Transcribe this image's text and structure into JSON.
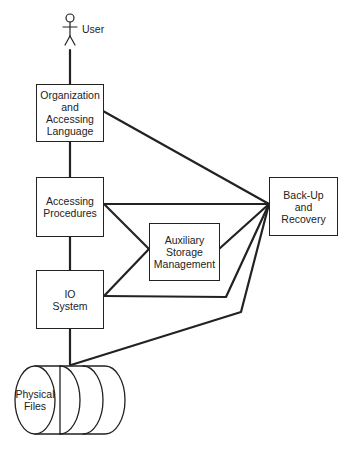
{
  "diagram": {
    "actor": {
      "label": "User"
    },
    "nodes": {
      "org_lang": {
        "label": "Organization\nand\nAccessing\nLanguage"
      },
      "access_proc": {
        "label": "Accessing\nProcedures"
      },
      "io_system": {
        "label": "IO\nSystem"
      },
      "aux_storage": {
        "label": "Auxiliary\nStorage\nManagement"
      },
      "backup": {
        "label": "Back-Up\nand\nRecovery"
      },
      "physical_files": {
        "label": "Physical\nFiles"
      }
    },
    "edges": [
      {
        "from": "User",
        "to": "Organization and Accessing Language"
      },
      {
        "from": "Organization and Accessing Language",
        "to": "Accessing Procedures"
      },
      {
        "from": "Accessing Procedures",
        "to": "IO System"
      },
      {
        "from": "IO System",
        "to": "Physical Files"
      },
      {
        "from": "Organization and Accessing Language",
        "to": "Back-Up and Recovery"
      },
      {
        "from": "Accessing Procedures",
        "to": "Back-Up and Recovery"
      },
      {
        "from": "Accessing Procedures",
        "to": "Auxiliary Storage Management"
      },
      {
        "from": "IO System",
        "to": "Auxiliary Storage Management"
      },
      {
        "from": "Auxiliary Storage Management",
        "to": "Back-Up and Recovery"
      },
      {
        "from": "IO System",
        "to": "Back-Up and Recovery"
      },
      {
        "from": "Physical Files",
        "to": "Back-Up and Recovery"
      }
    ],
    "colors": {
      "stroke": "#222222",
      "background": "#ffffff"
    }
  }
}
